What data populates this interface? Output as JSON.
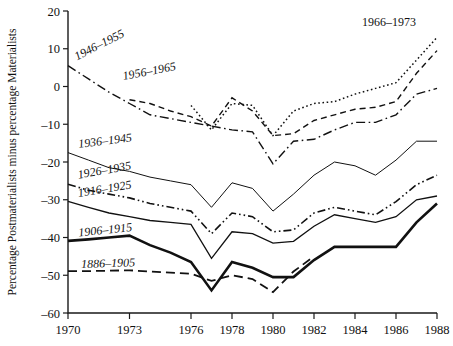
{
  "chart_data": {
    "type": "line",
    "title": "",
    "xlabel": "",
    "ylabel": "Percentage Postmaterialists minus percentage Materialists",
    "xlim": [
      1970,
      1988
    ],
    "ylim": [
      -60,
      20
    ],
    "ytick_labels": [
      "20",
      "10",
      "0",
      "-10",
      "-20",
      "-30",
      "-40",
      "-50",
      "-60"
    ],
    "ytick_values": [
      20,
      10,
      0,
      -10,
      -20,
      -30,
      -40,
      -50,
      -60
    ],
    "xtick_labels": [
      "1970",
      "1973",
      "1976",
      "1978",
      "1980",
      "1982",
      "1984",
      "1986",
      "1988"
    ],
    "xtick_values": [
      1970,
      1973,
      1976,
      1978,
      1980,
      1982,
      1984,
      1986,
      1988
    ],
    "grid": false,
    "legend_position": "inline-labels",
    "x": [
      1970,
      1971,
      1972,
      1973,
      1974,
      1975,
      1976,
      1977,
      1978,
      1979,
      1980,
      1981,
      1982,
      1983,
      1984,
      1985,
      1986,
      1987,
      1988
    ],
    "series": [
      {
        "name": "1966-1973",
        "label": "1966–1973",
        "style": "dotted",
        "width": 1.5,
        "label_x": 1984.2,
        "label_y": 15.0,
        "label_rotate": 0,
        "values": [
          null,
          null,
          null,
          null,
          null,
          null,
          -5.0,
          -11.5,
          -4.5,
          -5.0,
          -13.0,
          -6.5,
          -4.5,
          -4.0,
          -2.0,
          -0.5,
          1.0,
          7.0,
          13.0
        ]
      },
      {
        "name": "1956-1965",
        "label": "1956–1965",
        "style": "dashed",
        "width": 1.4,
        "label_x": 1972.6,
        "label_y": 0.5,
        "label_rotate": 11,
        "values": [
          null,
          null,
          null,
          -3.5,
          -4.5,
          -6.5,
          -8.0,
          -10.5,
          -3.0,
          -6.5,
          -13.0,
          -12.5,
          -9.0,
          -7.5,
          -6.0,
          -5.5,
          -4.0,
          3.5,
          9.5
        ]
      },
      {
        "name": "1946-1955",
        "label": "1946–1955",
        "style": "dashdot",
        "width": 1.4,
        "label_x": 1970.4,
        "label_y": 5.6,
        "label_rotate": 27,
        "values": [
          5.5,
          2.0,
          -1.5,
          -4.5,
          -7.5,
          -8.5,
          -9.5,
          -10.5,
          -11.5,
          -12.0,
          -20.5,
          -14.5,
          -14.0,
          -11.5,
          -9.5,
          -9.5,
          -7.5,
          -2.0,
          -0.5
        ]
      },
      {
        "name": "1936-1945",
        "label": "1936–1945",
        "style": "solid",
        "width": 1.0,
        "label_x": 1970.4,
        "label_y": -17.4,
        "label_rotate": 7,
        "values": [
          -17.5,
          -19.5,
          -21.5,
          -22.5,
          -24.0,
          -25.0,
          -26.0,
          -32.0,
          -25.5,
          -27.0,
          -33.0,
          -28.5,
          -23.5,
          -20.0,
          -21.0,
          -23.5,
          -19.5,
          -14.5,
          -14.5
        ]
      },
      {
        "name": "1926-1935",
        "label": "1926–1935",
        "style": "dashdotdot",
        "width": 1.6,
        "label_x": 1970.4,
        "label_y": -25.6,
        "label_rotate": 10,
        "values": [
          -25.9,
          -27.5,
          -28.5,
          -29.5,
          -31.0,
          -32.0,
          -33.0,
          -39.0,
          -33.5,
          -34.5,
          -38.5,
          -38.0,
          -33.5,
          -32.0,
          -33.0,
          -34.0,
          -30.5,
          -26.0,
          -23.5
        ]
      },
      {
        "name": "1916-1925",
        "label": "1916–1925",
        "style": "solid",
        "width": 1.3,
        "label_x": 1970.4,
        "label_y": -30.4,
        "label_rotate": 9,
        "values": [
          -30.4,
          -32.0,
          -33.5,
          -34.5,
          -35.5,
          -36.0,
          -36.5,
          -45.5,
          -38.5,
          -39.0,
          -41.5,
          -41.0,
          -37.0,
          -34.0,
          -35.0,
          -36.0,
          -34.5,
          -30.0,
          -29.0
        ]
      },
      {
        "name": "1906-1915",
        "label": "1906–1915",
        "style": "solid",
        "width": 2.6,
        "label_x": 1970.4,
        "label_y": -40.9,
        "label_rotate": 6,
        "values": [
          -40.9,
          -40.5,
          -40.0,
          -39.5,
          -42.0,
          -44.0,
          -46.5,
          -54.0,
          -46.5,
          -48.0,
          -50.5,
          -50.5,
          -46.0,
          -42.5,
          -42.5,
          -42.5,
          -42.5,
          -36.0,
          -31.0
        ]
      },
      {
        "name": "1886-1905",
        "label": "1886–1905",
        "style": "longdash",
        "width": 1.8,
        "label_x": 1970.5,
        "label_y": -49.2,
        "label_rotate": 2,
        "values": [
          -48.9,
          -48.9,
          -48.8,
          -48.7,
          -49.0,
          -49.3,
          -49.6,
          -51.5,
          -50.0,
          -51.0,
          -54.5,
          -49.0,
          -45.0,
          null,
          null,
          null,
          null,
          null,
          null
        ]
      }
    ]
  }
}
